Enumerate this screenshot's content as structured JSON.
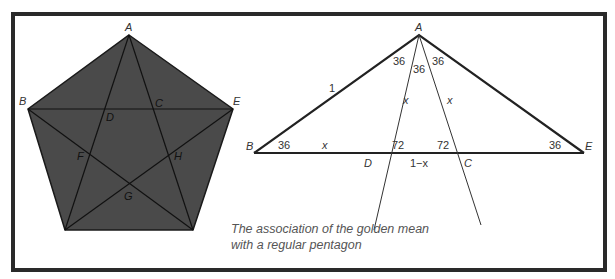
{
  "caption": {
    "line1": "The association of the golden mean",
    "line2": "with a regular pentagon"
  },
  "pentagon": {
    "fill": "#4a4a4a",
    "vertices": {
      "A": [
        129,
        35
      ],
      "B": [
        28,
        109
      ],
      "E": [
        233,
        109
      ],
      "bottom_left": [
        65,
        230
      ],
      "bottom_right": [
        193,
        230
      ]
    },
    "labels": {
      "A": "A",
      "B": "B",
      "C": "C",
      "D": "D",
      "E": "E",
      "F": "F",
      "G": "G",
      "H": "H"
    }
  },
  "triangle": {
    "vertices": {
      "A": [
        419,
        35
      ],
      "B": [
        254,
        153
      ],
      "E": [
        584,
        153
      ],
      "D": [
        382,
        153
      ],
      "C": [
        457,
        153
      ]
    },
    "labels": {
      "A": "A",
      "B": "B",
      "E": "E",
      "D": "D",
      "C": "C",
      "side_AB": "1",
      "angle_A_left": "36",
      "angle_A_mid": "36",
      "angle_A_right": "36",
      "angle_B": "36",
      "angle_E": "36",
      "angle_D": "72",
      "angle_C": "72",
      "seg_AD": "x",
      "seg_AC": "x",
      "seg_BD": "x",
      "seg_DC": "1−x"
    }
  }
}
